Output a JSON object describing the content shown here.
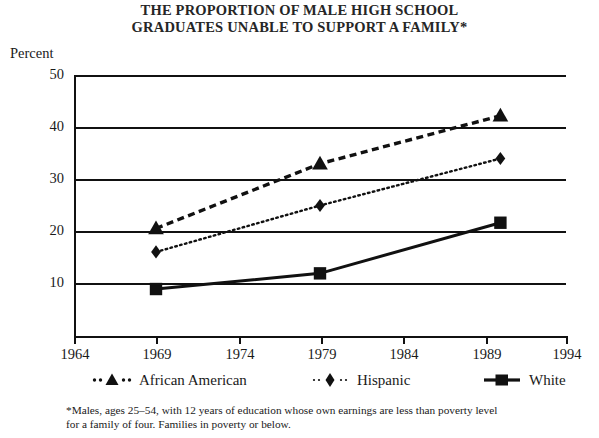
{
  "chart_data": {
    "type": "line",
    "title": "THE PROPORTION OF MALE HIGH SCHOOL GRADUATES UNABLE TO SUPPORT A FAMILY*",
    "title_lines": [
      "THE PROPORTION OF MALE HIGH SCHOOL",
      "GRADUATES UNABLE TO SUPPORT A FAMILY*"
    ],
    "xlabel": "",
    "ylabel": "Percent",
    "xlim": [
      1964,
      1994
    ],
    "ylim": [
      0,
      50
    ],
    "grid": true,
    "legend_position": "below-axes",
    "xticks": [
      1964,
      1969,
      1974,
      1979,
      1984,
      1989,
      1994
    ],
    "xticklabels": [
      "1964",
      "1969",
      "1974",
      "1979",
      "1984",
      "1989",
      "1994"
    ],
    "yticks": [
      10,
      20,
      30,
      40,
      50
    ],
    "yticklabels": [
      "10",
      "20",
      "30",
      "40",
      "50"
    ],
    "x": [
      1969,
      1979,
      1990
    ],
    "series": [
      {
        "name": "African American",
        "marker": "triangle",
        "linestyle": "dashed",
        "color": "#111111",
        "values": [
          20.6,
          33.0,
          42.2
        ]
      },
      {
        "name": "Hispanic",
        "marker": "diamond",
        "linestyle": "dotted",
        "color": "#111111",
        "values": [
          16.1,
          25.0,
          34.0
        ]
      },
      {
        "name": "White",
        "marker": "square",
        "linestyle": "solid",
        "color": "#111111",
        "values": [
          9.0,
          12.0,
          21.7
        ]
      }
    ],
    "annotations": [],
    "footnote_lines": [
      "*Males, ages 25–54, with 12 years of education whose own earnings are less than poverty level",
      "for a family of four. Families in poverty or below."
    ]
  },
  "legend": {
    "items": [
      {
        "label": "African American",
        "marker": "triangle",
        "linestyle": "dashed"
      },
      {
        "label": "Hispanic",
        "marker": "diamond",
        "linestyle": "dotted"
      },
      {
        "label": "White",
        "marker": "square",
        "linestyle": "solid"
      }
    ]
  },
  "colors": {
    "ink": "#111111",
    "background": "#ffffff",
    "title": "#262626"
  }
}
